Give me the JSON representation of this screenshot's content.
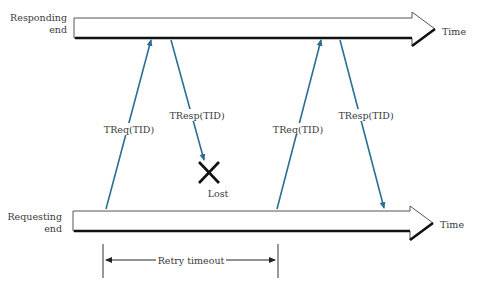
{
  "diagram": {
    "responding_end": {
      "line1": "Responding",
      "line2": "end",
      "time_label": "Time"
    },
    "requesting_end": {
      "line1": "Requesting",
      "line2": "end",
      "time_label": "Time"
    },
    "messages": [
      {
        "label": "TReq(TID)",
        "direction": "up"
      },
      {
        "label": "TResp(TID)",
        "direction": "down",
        "status": "lost"
      },
      {
        "label": "TReq(TID)",
        "direction": "up"
      },
      {
        "label": "TResp(TID)",
        "direction": "down"
      }
    ],
    "lost_label": "Lost",
    "retry_timeout_label": "Retry timeout",
    "colors": {
      "message_arrow": "#2b6f96",
      "timeline": "#111111",
      "lost_mark": "#111111"
    }
  }
}
